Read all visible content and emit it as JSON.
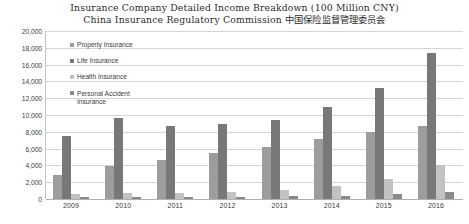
{
  "chart_data": {
    "type": "bar",
    "title": "Insurance Company Detailed Income Breakdown (100 Million CNY)",
    "subtitle": "China Insurance Regulatory Commission 中国保险监督管理委员会",
    "xlabel": "",
    "ylabel": "",
    "ylim": [
      0,
      20000
    ],
    "ytick_labels": [
      "20,000",
      "18,000",
      "16,000",
      "14,000",
      "12,000",
      "10,000",
      "8,000",
      "6,000",
      "4,000",
      "2,000",
      "0"
    ],
    "ytick_values": [
      20000,
      18000,
      16000,
      14000,
      12000,
      10000,
      8000,
      6000,
      4000,
      2000,
      0
    ],
    "grid": true,
    "legend_position": "inside-top-left",
    "categories": [
      "2009",
      "2010",
      "2011",
      "2012",
      "2013",
      "2014",
      "2015",
      "2016"
    ],
    "series": [
      {
        "name": "Property Insurance",
        "color": "#9d9d9d",
        "values": [
          2876,
          3896,
          4618,
          5531,
          6212,
          7204,
          7995,
          8725
        ]
      },
      {
        "name": "Life Insurance",
        "color": "#787878",
        "values": [
          7457,
          9680,
          8696,
          8908,
          9425,
          10902,
          13242,
          17442
        ]
      },
      {
        "name": "Health Insurance",
        "color": "#c2c2c2",
        "values": [
          574,
          677,
          692,
          863,
          1124,
          1587,
          2410,
          4042
        ]
      },
      {
        "name": "Personal Accident Insurance",
        "color": "#8a8a8a",
        "values": [
          197,
          223,
          257,
          297,
          343,
          405,
          635,
          861
        ]
      }
    ],
    "legend_labels": [
      "Property Insurance",
      "Life Insurance",
      "Health Insurance",
      "Personal Accident\nInsurance"
    ]
  }
}
